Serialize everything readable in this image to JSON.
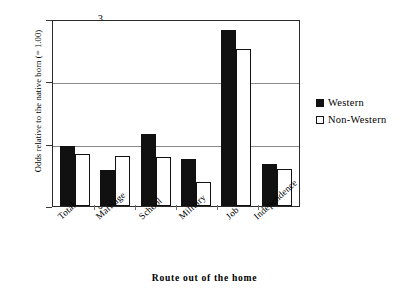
{
  "chart_data": {
    "type": "bar",
    "title": "",
    "subtitle": "",
    "xlabel": "Route out of the home",
    "ylabel": "Odds relative to the native born (= 1.00)",
    "categories": [
      "Total",
      "Marriage",
      "School",
      "Military",
      "Job",
      "Independence"
    ],
    "series": [
      {
        "name": "Western",
        "values": [
          0.96,
          0.57,
          1.15,
          0.76,
          2.82,
          0.67
        ]
      },
      {
        "name": "Non-Western",
        "values": [
          0.84,
          0.8,
          0.78,
          0.38,
          2.52,
          0.6
        ]
      }
    ],
    "ylim": [
      0,
      3
    ],
    "yticks": [
      "0",
      "1",
      "2",
      "3"
    ],
    "ytick_values": [
      0,
      1,
      2,
      3
    ],
    "grid": true,
    "grid_axis": "y",
    "legend_position": "right",
    "colors": {
      "western": "#111111",
      "non_western": "#ffffff",
      "border": "#111111",
      "gridline": "#8a8a8a",
      "axis": "#2b2b2b",
      "background": "#ffffff",
      "text": "#000000"
    }
  },
  "legend": {
    "items": [
      {
        "label": "Western",
        "swatch": "filled-square"
      },
      {
        "label": "Non-Western",
        "swatch": "outlined-square"
      }
    ]
  }
}
